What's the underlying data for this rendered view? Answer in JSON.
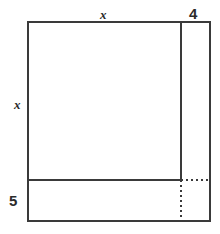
{
  "figure": {
    "background_color": "#ffffff",
    "stroke_color": "#3a3a3a",
    "stroke_width": 2,
    "dash_color": "#3a3a3a",
    "dash_pattern": "2 3",
    "bounds": {
      "left": 28,
      "top": 22,
      "right": 210,
      "bottom": 221,
      "width": 182,
      "height": 199
    },
    "dividers": {
      "vertical_x": 181,
      "horizontal_y": 180
    }
  },
  "labels": [
    {
      "id": "top-x",
      "text": "x",
      "style": "variable",
      "side": "top",
      "meaning": "width of the large square region",
      "x": 100,
      "y": 8
    },
    {
      "id": "left-x",
      "text": "x",
      "style": "variable",
      "side": "left",
      "meaning": "height of the large square region",
      "x": 14,
      "y": 98
    },
    {
      "id": "right-4",
      "text": "4",
      "style": "number",
      "side": "top",
      "meaning": "width of the narrow right strip",
      "x": 189,
      "y": 6
    },
    {
      "id": "bottom-5",
      "text": "5",
      "style": "number",
      "side": "left",
      "meaning": "height of the bottom strip",
      "x": 9,
      "y": 193
    }
  ],
  "segments": {
    "solid": [
      {
        "name": "outer-top-edge",
        "x1": 28,
        "y1": 22,
        "x2": 210,
        "y2": 22
      },
      {
        "name": "outer-right-edge",
        "x1": 210,
        "y1": 22,
        "x2": 210,
        "y2": 221
      },
      {
        "name": "outer-bottom-edge",
        "x1": 28,
        "y1": 221,
        "x2": 210,
        "y2": 221
      },
      {
        "name": "outer-left-edge",
        "x1": 28,
        "y1": 22,
        "x2": 28,
        "y2": 221
      },
      {
        "name": "vertical-divider",
        "x1": 181,
        "y1": 22,
        "x2": 181,
        "y2": 180
      },
      {
        "name": "horizontal-divider",
        "x1": 28,
        "y1": 180,
        "x2": 181,
        "y2": 180
      }
    ],
    "dashed": [
      {
        "name": "dashed-horizontal-extension",
        "x1": 181,
        "y1": 180,
        "x2": 210,
        "y2": 180
      },
      {
        "name": "dashed-vertical-extension",
        "x1": 181,
        "y1": 180,
        "x2": 181,
        "y2": 221
      }
    ]
  }
}
